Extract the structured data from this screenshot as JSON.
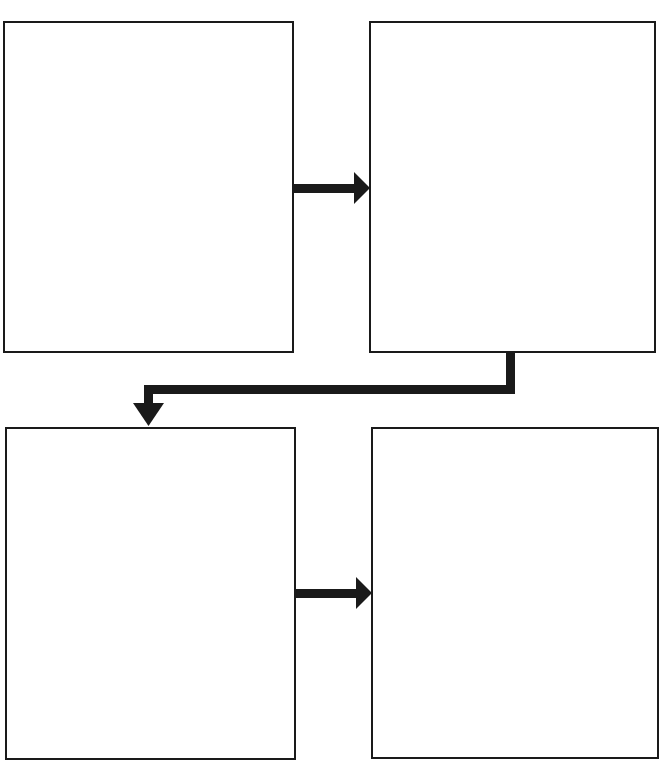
{
  "diagram": {
    "type": "flowchart",
    "layout": "2x2 grid",
    "header_cutoff_text": "",
    "boxes": [
      {
        "id": "box-1",
        "position": "top-left",
        "text": ""
      },
      {
        "id": "box-2",
        "position": "top-right",
        "text": ""
      },
      {
        "id": "box-3",
        "position": "bottom-left",
        "text": ""
      },
      {
        "id": "box-4",
        "position": "bottom-right",
        "text": ""
      }
    ],
    "arrows": [
      {
        "from": "box-1",
        "to": "box-2",
        "direction": "right"
      },
      {
        "from": "box-2",
        "to": "box-3",
        "direction": "elbow-left-down"
      },
      {
        "from": "box-3",
        "to": "box-4",
        "direction": "right"
      }
    ],
    "colors": {
      "stroke": "#1a1a1a",
      "arrow": "#1a1a1a",
      "background": "#ffffff"
    }
  }
}
